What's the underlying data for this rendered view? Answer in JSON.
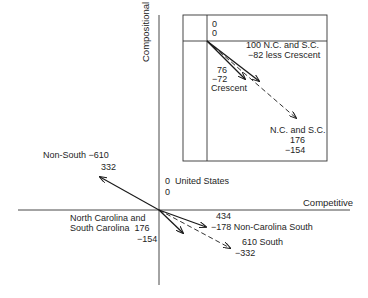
{
  "axes": {
    "vertical_label": "Compositional",
    "horizontal_label": "Competitive"
  },
  "main": {
    "origin": {
      "name": "United States",
      "x": "0",
      "y": "0"
    },
    "vectors": [
      {
        "name": "Non-South",
        "competitive": "-610",
        "compositional": "332",
        "style": "solid"
      },
      {
        "name_line1": "North Carolina and",
        "name_line2": "South Carolina",
        "competitive": "176",
        "compositional": "-154",
        "style": "solid"
      },
      {
        "name": "Non-Carolina South",
        "competitive": "434",
        "compositional": "-178",
        "style": "solid"
      },
      {
        "name": "South",
        "competitive": "610",
        "compositional": "-332",
        "style": "dashed"
      }
    ]
  },
  "inset": {
    "origin": {
      "x": "0",
      "y": "0"
    },
    "vectors": [
      {
        "name_line1": "N.C. and S.C.",
        "name_line2": "less Crescent",
        "competitive": "100",
        "compositional": "-82",
        "style": "solid"
      },
      {
        "name": "Crescent",
        "competitive": "76",
        "compositional": "-72",
        "style": "solid"
      },
      {
        "name": "N.C. and S.C.",
        "competitive": "176",
        "compositional": "-154",
        "style": "dashed"
      }
    ]
  }
}
